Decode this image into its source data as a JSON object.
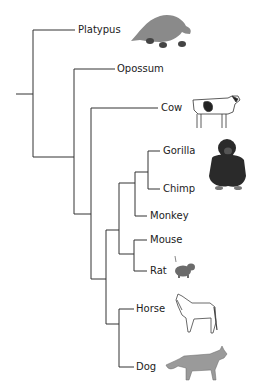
{
  "diagram": {
    "type": "phylogenetic-tree",
    "line_color": "#333333",
    "taxa": [
      {
        "name": "Platypus",
        "y": 30,
        "x_label": 78,
        "icon": "platypus-icon"
      },
      {
        "name": "Opossum",
        "y": 69,
        "x_label": 117,
        "icon": null
      },
      {
        "name": "Cow",
        "y": 108,
        "x_label": 161,
        "icon": "cow-icon"
      },
      {
        "name": "Gorilla",
        "y": 151,
        "x_label": 163,
        "icon": null
      },
      {
        "name": "Chimp",
        "y": 189,
        "x_label": 163,
        "icon": "chimp-icon"
      },
      {
        "name": "Monkey",
        "y": 216,
        "x_label": 150,
        "icon": null
      },
      {
        "name": "Mouse",
        "y": 240,
        "x_label": 150,
        "icon": null
      },
      {
        "name": "Rat",
        "y": 271,
        "x_label": 150,
        "icon": "rat-icon"
      },
      {
        "name": "Horse",
        "y": 309,
        "x_label": 136,
        "icon": "horse-icon"
      },
      {
        "name": "Dog",
        "y": 367,
        "x_label": 136,
        "icon": "dog-icon"
      }
    ],
    "labels": {
      "platypus": "Platypus",
      "opossum": "Opossum",
      "cow": "Cow",
      "gorilla": "Gorilla",
      "chimp": "Chimp",
      "monkey": "Monkey",
      "mouse": "Mouse",
      "rat": "Rat",
      "horse": "Horse",
      "dog": "Dog"
    },
    "colors": {
      "platypus": "#8a8a8a",
      "cow_body": "#ffffff",
      "cow_spot": "#222222",
      "chimp": "#2a2a2a",
      "rat": "#6b6b6b",
      "horse_outline": "#444444",
      "dog": "#9a9a9a"
    }
  }
}
